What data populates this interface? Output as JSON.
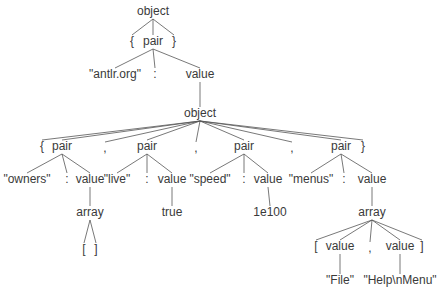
{
  "diagram": {
    "type": "parse-tree",
    "nodes": [
      {
        "id": "n0",
        "label": "object",
        "parent": null
      },
      {
        "id": "n1",
        "label": "{",
        "parent": "n0"
      },
      {
        "id": "n2",
        "label": "pair",
        "parent": "n0"
      },
      {
        "id": "n3",
        "label": "}",
        "parent": "n0"
      },
      {
        "id": "n4",
        "label": "\"antlr.org\"",
        "parent": "n2"
      },
      {
        "id": "n5",
        "label": ":",
        "parent": "n2"
      },
      {
        "id": "n6",
        "label": "value",
        "parent": "n2"
      },
      {
        "id": "n7",
        "label": "object",
        "parent": "n6"
      },
      {
        "id": "n8",
        "label": "{",
        "parent": "n7"
      },
      {
        "id": "n9",
        "label": "pair",
        "parent": "n7"
      },
      {
        "id": "n10",
        "label": ",",
        "parent": "n7"
      },
      {
        "id": "n11",
        "label": "pair",
        "parent": "n7"
      },
      {
        "id": "n12",
        "label": ",",
        "parent": "n7"
      },
      {
        "id": "n13",
        "label": "pair",
        "parent": "n7"
      },
      {
        "id": "n14",
        "label": ",",
        "parent": "n7"
      },
      {
        "id": "n15",
        "label": "pair",
        "parent": "n7"
      },
      {
        "id": "n16",
        "label": "}",
        "parent": "n7"
      },
      {
        "id": "n17",
        "label": "\"owners\"",
        "parent": "n9"
      },
      {
        "id": "n18",
        "label": ":",
        "parent": "n9"
      },
      {
        "id": "n19",
        "label": "value",
        "parent": "n9"
      },
      {
        "id": "n20",
        "label": "\"live\"",
        "parent": "n11"
      },
      {
        "id": "n21",
        "label": ":",
        "parent": "n11"
      },
      {
        "id": "n22",
        "label": "value",
        "parent": "n11"
      },
      {
        "id": "n23",
        "label": "\"speed\"",
        "parent": "n13"
      },
      {
        "id": "n24",
        "label": ":",
        "parent": "n13"
      },
      {
        "id": "n25",
        "label": "value",
        "parent": "n13"
      },
      {
        "id": "n26",
        "label": "\"menus\"",
        "parent": "n15"
      },
      {
        "id": "n27",
        "label": ":",
        "parent": "n15"
      },
      {
        "id": "n28",
        "label": "value",
        "parent": "n15"
      },
      {
        "id": "n29",
        "label": "array",
        "parent": "n19"
      },
      {
        "id": "n30",
        "label": "true",
        "parent": "n22"
      },
      {
        "id": "n31",
        "label": "1e100",
        "parent": "n25"
      },
      {
        "id": "n32",
        "label": "array",
        "parent": "n28"
      },
      {
        "id": "n33",
        "label": "[",
        "parent": "n29"
      },
      {
        "id": "n34",
        "label": "]",
        "parent": "n29"
      },
      {
        "id": "n35",
        "label": "[",
        "parent": "n32"
      },
      {
        "id": "n36",
        "label": "value",
        "parent": "n32"
      },
      {
        "id": "n37",
        "label": ",",
        "parent": "n32"
      },
      {
        "id": "n38",
        "label": "value",
        "parent": "n32"
      },
      {
        "id": "n39",
        "label": "]",
        "parent": "n32"
      },
      {
        "id": "n40",
        "label": "\"File\"",
        "parent": "n36"
      },
      {
        "id": "n41",
        "label": "\"Help\\nMenu\"",
        "parent": "n38"
      }
    ]
  }
}
